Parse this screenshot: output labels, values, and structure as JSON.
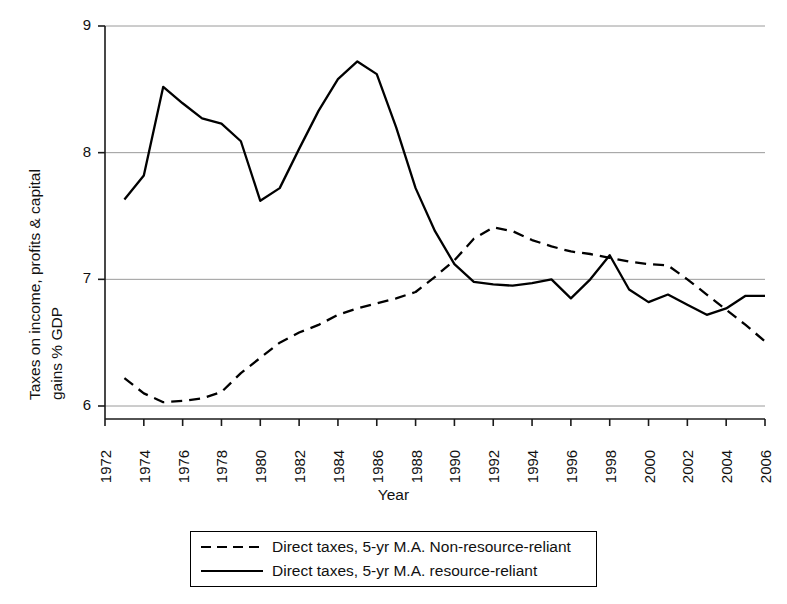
{
  "chart_data": {
    "type": "line",
    "title": "",
    "xlabel": "Year",
    "ylabel": "Taxes on income, profits & capital gains % GDP",
    "ylabel_line1": "Taxes on income, profits & capital",
    "ylabel_line2": "gains % GDP",
    "xlim": [
      1972,
      2006
    ],
    "ylim": [
      6,
      9
    ],
    "yticks": [
      6,
      7,
      8,
      9
    ],
    "ytick_labels": [
      "6",
      "7",
      "8",
      "9"
    ],
    "xticks": [
      1972,
      1974,
      1976,
      1978,
      1980,
      1982,
      1984,
      1986,
      1988,
      1990,
      1992,
      1994,
      1996,
      1998,
      2000,
      2002,
      2004,
      2006
    ],
    "xtick_labels": [
      "1972",
      "1974",
      "1976",
      "1978",
      "1980",
      "1982",
      "1984",
      "1986",
      "1988",
      "1990",
      "1992",
      "1994",
      "1996",
      "1998",
      "2000",
      "2002",
      "2004",
      "2006"
    ],
    "grid": "horizontal",
    "legend_position": "below-axes",
    "series": [
      {
        "name": "Direct taxes, 5-yr M.A. Non-resource-reliant",
        "style": "dashed",
        "color": "#000000",
        "x": [
          1973,
          1974,
          1975,
          1976,
          1977,
          1978,
          1979,
          1980,
          1981,
          1982,
          1983,
          1984,
          1985,
          1986,
          1987,
          1988,
          1989,
          1990,
          1991,
          1992,
          1993,
          1994,
          1995,
          1996,
          1997,
          1998,
          1999,
          2000,
          2001,
          2002,
          2003,
          2004,
          2005,
          2006
        ],
        "values": [
          6.22,
          6.1,
          6.03,
          6.04,
          6.06,
          6.11,
          6.26,
          6.38,
          6.5,
          6.58,
          6.64,
          6.72,
          6.77,
          6.81,
          6.85,
          6.9,
          7.02,
          7.15,
          7.32,
          7.41,
          7.38,
          7.31,
          7.26,
          7.22,
          7.2,
          7.17,
          7.14,
          7.12,
          7.11,
          7.0,
          6.88,
          6.76,
          6.64,
          6.51
        ]
      },
      {
        "name": "Direct taxes, 5-yr M.A. resource-reliant",
        "style": "solid",
        "color": "#000000",
        "x": [
          1973,
          1974,
          1975,
          1976,
          1977,
          1978,
          1979,
          1980,
          1981,
          1982,
          1983,
          1984,
          1985,
          1986,
          1987,
          1988,
          1989,
          1990,
          1991,
          1992,
          1993,
          1994,
          1995,
          1996,
          1997,
          1998,
          1999,
          2000,
          2001,
          2002,
          2003,
          2004,
          2005,
          2006
        ],
        "values": [
          7.63,
          7.82,
          8.52,
          8.39,
          8.27,
          8.23,
          8.09,
          7.62,
          7.72,
          8.03,
          8.33,
          8.58,
          8.72,
          8.62,
          8.2,
          7.72,
          7.38,
          7.12,
          6.98,
          6.96,
          6.95,
          6.97,
          7.0,
          6.85,
          7.0,
          7.19,
          6.92,
          6.82,
          6.88,
          6.8,
          6.72,
          6.77,
          6.87,
          6.87
        ]
      }
    ]
  },
  "axes": {
    "xlabel": "Year",
    "ylabel_line1": "Taxes on income, profits & capital",
    "ylabel_line2": "gains % GDP"
  },
  "legend": {
    "items": [
      {
        "label": "Direct taxes, 5-yr M.A. Non-resource-reliant",
        "style": "dashed"
      },
      {
        "label": "Direct taxes, 5-yr M.A. resource-reliant",
        "style": "solid"
      }
    ]
  }
}
